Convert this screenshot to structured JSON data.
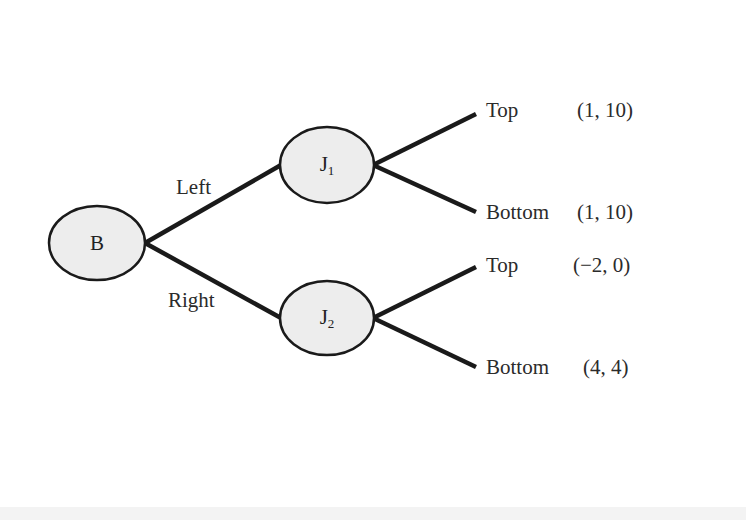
{
  "diagram": {
    "type": "game-tree",
    "root": {
      "id": "B",
      "label": "B"
    },
    "nodes": [
      {
        "id": "J1",
        "label": "J",
        "subscript": "1"
      },
      {
        "id": "J2",
        "label": "J",
        "subscript": "2"
      }
    ],
    "root_branches": [
      {
        "label": "Left",
        "to": "J1"
      },
      {
        "label": "Right",
        "to": "J2"
      }
    ],
    "leaves": [
      {
        "from": "J1",
        "action": "Top",
        "payoff": "(1, 10)"
      },
      {
        "from": "J1",
        "action": "Bottom",
        "payoff": "(1, 10)"
      },
      {
        "from": "J2",
        "action": "Top",
        "payoff": "(−2, 0)"
      },
      {
        "from": "J2",
        "action": "Bottom",
        "payoff": "(4, 4)"
      }
    ],
    "colors": {
      "node_fill": "#ededed",
      "stroke": "#1a1a1a",
      "background": "#ffffff"
    }
  }
}
